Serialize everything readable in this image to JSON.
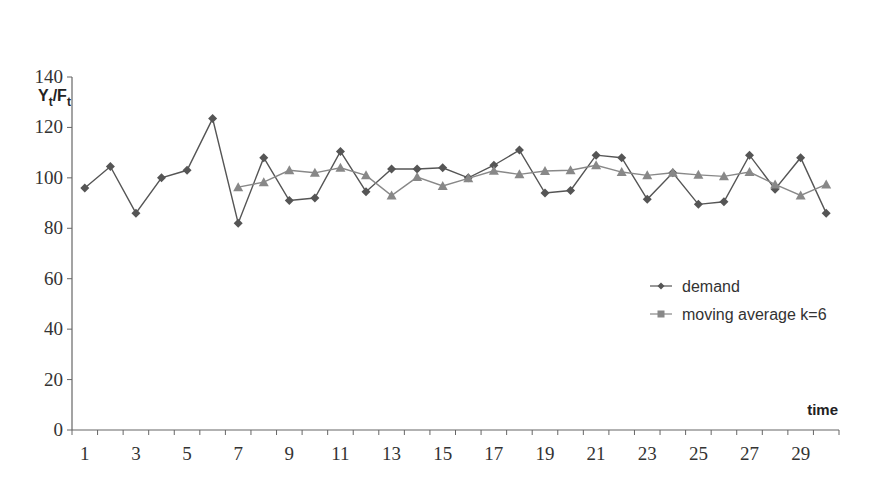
{
  "chart_data": {
    "type": "line",
    "title": "",
    "ylabel": "Yt/Ft",
    "ylabel_main": "Y",
    "ylabel_sub1": "t",
    "ylabel_sep": "/F",
    "ylabel_sub2": "t",
    "xlabel": "time",
    "ylim": [
      0,
      140
    ],
    "yticks": [
      0,
      20,
      40,
      60,
      80,
      100,
      120,
      140
    ],
    "xlim": [
      0.5,
      30.5
    ],
    "xtick_labels": [
      1,
      3,
      5,
      7,
      9,
      11,
      13,
      15,
      17,
      19,
      21,
      23,
      25,
      27,
      29
    ],
    "x": [
      1,
      2,
      3,
      4,
      5,
      6,
      7,
      8,
      9,
      10,
      11,
      12,
      13,
      14,
      15,
      16,
      17,
      18,
      19,
      20,
      21,
      22,
      23,
      24,
      25,
      26,
      27,
      28,
      29,
      30
    ],
    "grid": false,
    "legend_position": "right-middle",
    "series": [
      {
        "name": "demand",
        "marker": "diamond",
        "color": "#555555",
        "values": [
          96,
          104.5,
          86,
          100,
          103,
          123.5,
          82,
          108,
          91,
          92,
          110.5,
          94.5,
          103.5,
          103.5,
          104,
          100,
          105,
          111,
          94,
          95,
          109,
          108,
          91.5,
          102,
          89.5,
          90.5,
          109,
          95.5,
          108,
          86
        ]
      },
      {
        "name": "moving average k=6",
        "marker": "triangle",
        "color": "#888888",
        "values": [
          null,
          null,
          null,
          null,
          null,
          null,
          96.3,
          98.3,
          103,
          102,
          104,
          101,
          93,
          100.3,
          96.8,
          99.8,
          102.8,
          101.4,
          102.7,
          103,
          105,
          102.3,
          101,
          102,
          101.2,
          100.6,
          102.3,
          97.4,
          93,
          97.4
        ]
      }
    ]
  },
  "legend": {
    "items": [
      {
        "label": "demand"
      },
      {
        "label": "moving average k=6"
      }
    ]
  }
}
